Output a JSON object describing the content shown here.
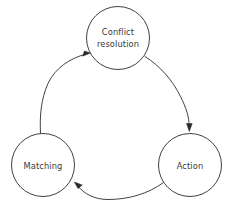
{
  "diagram": {
    "type": "cycle-diagram",
    "background_color": "#ffffff",
    "stroke_color": "#2b2b2b",
    "text_color": "#3a3a3a",
    "nodes": [
      {
        "id": "conflict-resolution",
        "label_lines": [
          "Conflict",
          "resolution"
        ],
        "label_line1": "Conflict",
        "label_line2": "resolution",
        "cx": 118,
        "cy": 38,
        "r": 31.5
      },
      {
        "id": "action",
        "label_lines": [
          "Action"
        ],
        "label_line1": "Action",
        "cx": 190,
        "cy": 165,
        "r": 31.5
      },
      {
        "id": "matching",
        "label_lines": [
          "Matching"
        ],
        "label_line1": "Matching",
        "cx": 43,
        "cy": 165,
        "r": 31.5
      }
    ],
    "edges": [
      {
        "id": "conflict-to-action",
        "from": "conflict-resolution",
        "to": "action",
        "direction": "clockwise",
        "arrow_at": "action"
      },
      {
        "id": "action-to-matching",
        "from": "action",
        "to": "matching",
        "direction": "clockwise",
        "arrow_at": "matching"
      },
      {
        "id": "matching-to-conflict",
        "from": "matching",
        "to": "conflict-resolution",
        "direction": "clockwise",
        "arrow_at": "conflict-resolution"
      }
    ]
  }
}
